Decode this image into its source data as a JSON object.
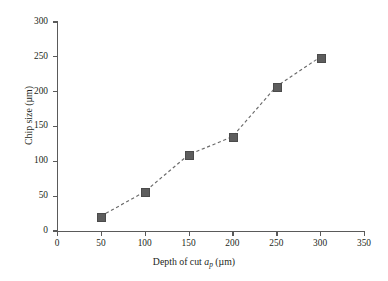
{
  "chart_data": {
    "type": "line",
    "title": "",
    "subtitle": "",
    "xlabel": "Depth of cut a_p (µm)",
    "xlabel_parts": {
      "pre": "Depth of cut ",
      "symbol": "a",
      "subscript": "p",
      "post": " (µm)"
    },
    "ylabel": "Chip size (µm)",
    "ylabel_parts": {
      "pre": "Chip size (",
      "symbol": "µm",
      "post": ")"
    },
    "x": [
      50,
      100,
      150,
      200,
      250,
      300
    ],
    "values": [
      21,
      56,
      109,
      135,
      207,
      249
    ],
    "series": [
      {
        "name": "Chip size",
        "x": [
          50,
          100,
          150,
          200,
          250,
          300
        ],
        "values": [
          21,
          56,
          109,
          135,
          207,
          249
        ]
      }
    ],
    "xlim": [
      0,
      350
    ],
    "ylim": [
      0,
      300
    ],
    "xticks": [
      0,
      50,
      100,
      150,
      200,
      250,
      300,
      350
    ],
    "yticks": [
      0,
      50,
      100,
      150,
      200,
      250,
      300
    ],
    "xticklabels": [
      "0",
      "50",
      "100",
      "150",
      "200",
      "250",
      "300",
      "350"
    ],
    "yticklabels": [
      "0",
      "50",
      "100",
      "150",
      "200",
      "250",
      "300"
    ],
    "grid": false,
    "legend": false,
    "legend_position": "none",
    "line_style": "dashed",
    "marker": "square",
    "colors": {
      "line": "#6b6b6b",
      "marker": "#5d5d5d",
      "axis": "#5a5a5a",
      "text": "#231f20",
      "background": "#ffffff"
    },
    "annotations": []
  }
}
